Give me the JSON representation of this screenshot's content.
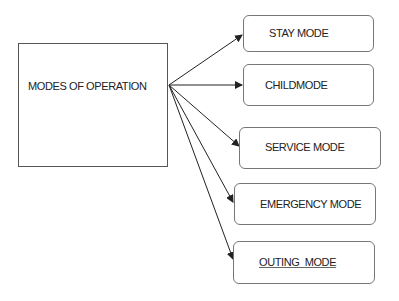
{
  "diagram": {
    "root": {
      "label": "MODES OF OPERATION"
    },
    "modes": [
      {
        "label": "STAY MODE"
      },
      {
        "label": "CHILDMODE"
      },
      {
        "label": "SERVICE MODE"
      },
      {
        "label": "EMERGENCY MODE"
      },
      {
        "label": "OUTING  MODE"
      }
    ],
    "colors": {
      "line": "#222222",
      "box_border": "#777777",
      "text": "#222222"
    }
  }
}
